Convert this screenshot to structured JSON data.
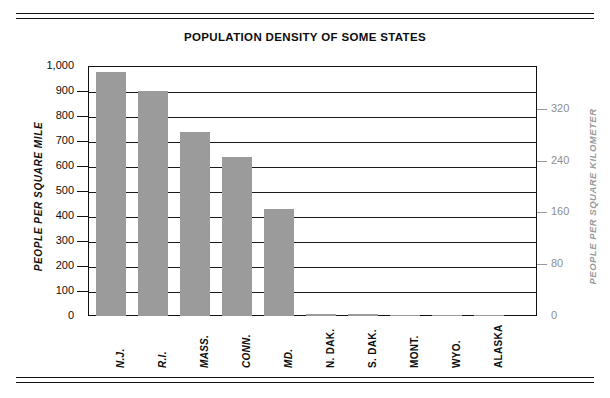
{
  "chart_data": {
    "type": "bar",
    "title": "POPULATION DENSITY OF SOME STATES",
    "xlabel": "",
    "ylabel": "PEOPLE PER SQUARE MILE",
    "y2label": "PEOPLE PER SQUARE KILOMETER",
    "categories": [
      "N.J.",
      "R.I.",
      "MASS.",
      "CONN.",
      "MD.",
      "N. DAK.",
      "S. DAK.",
      "MONT.",
      "WYO.",
      "ALASKA"
    ],
    "values": [
      975,
      900,
      735,
      635,
      430,
      9,
      10,
      6,
      5,
      1
    ],
    "ylim": [
      0,
      1000
    ],
    "yticks": [
      0,
      100,
      200,
      300,
      400,
      500,
      600,
      700,
      800,
      900,
      1000
    ],
    "ytick_labels": [
      "0",
      "100",
      "200",
      "300",
      "400",
      "500",
      "600",
      "700",
      "800",
      "900",
      "1,000"
    ],
    "y2lim": [
      0,
      386
    ],
    "y2ticks": [
      0,
      80,
      160,
      240,
      320
    ],
    "y2tick_labels": [
      "0",
      "80",
      "160",
      "240",
      "320"
    ],
    "grid": true,
    "legend": false,
    "bar_color": "#9b9b9b",
    "axis_color": "#111111",
    "secondary_axis_color": "#9a9a9a",
    "background": "#ffffff"
  },
  "decor": {
    "rule_label": "horizontal-rule"
  }
}
